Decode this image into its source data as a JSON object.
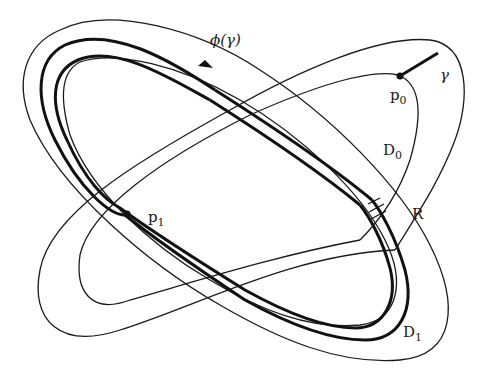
{
  "figure": {
    "labels": {
      "phi_gamma": "ϕ(γ)",
      "gamma": "γ",
      "p0_base": "p",
      "p0_sub": "0",
      "p1_base": "p",
      "p1_sub": "1",
      "D0_base": "D",
      "D0_sub": "0",
      "D1_base": "D",
      "D1_sub": "1",
      "R": "R"
    },
    "regions": [
      {
        "name": "D0",
        "orientation": "tilted up-right",
        "type": "annulus"
      },
      {
        "name": "D1",
        "orientation": "tilted down-right",
        "type": "annulus"
      }
    ],
    "points": [
      {
        "name": "p0",
        "location": "inner boundary of D0, upper right"
      },
      {
        "name": "p1",
        "location": "on phi(gamma), left-center"
      }
    ],
    "curves": [
      {
        "name": "gamma",
        "style": "thick segment",
        "from": "p0",
        "to": "outer boundary of D0"
      },
      {
        "name": "phi(gamma)",
        "style": "thick curve with arrow",
        "within": "D1"
      }
    ],
    "hatched_region": "R"
  }
}
